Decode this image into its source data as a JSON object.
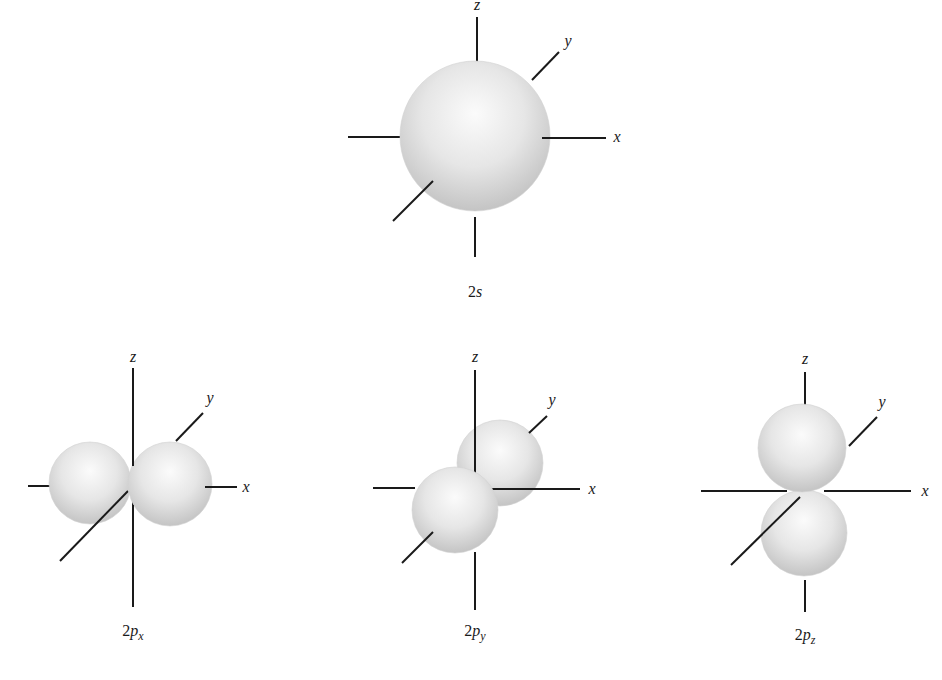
{
  "colors": {
    "axis": "#1a1a1a",
    "lobe_highlight": "#fbfbfb",
    "lobe_mid": "#e6e6e6",
    "lobe_edge": "#c4c4c4",
    "background": "#ffffff"
  },
  "orbitals": [
    {
      "id": "2s",
      "caption": {
        "main": "2",
        "italic": "s",
        "sub": ""
      },
      "axis_labels": {
        "x": "x",
        "y": "y",
        "z": "z"
      }
    },
    {
      "id": "2px",
      "caption": {
        "main": "2",
        "italic": "p",
        "sub": "x"
      },
      "axis_labels": {
        "x": "x",
        "y": "y",
        "z": "z"
      }
    },
    {
      "id": "2py",
      "caption": {
        "main": "2",
        "italic": "p",
        "sub": "y"
      },
      "axis_labels": {
        "x": "x",
        "y": "y",
        "z": "z"
      }
    },
    {
      "id": "2pz",
      "caption": {
        "main": "2",
        "italic": "p",
        "sub": "z"
      },
      "axis_labels": {
        "x": "x",
        "y": "y",
        "z": "z"
      }
    }
  ]
}
